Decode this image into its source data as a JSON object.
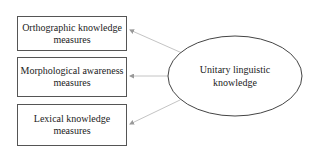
{
  "diagram": {
    "factor": {
      "line1": "Unitary linguistic",
      "line2": "knowledge"
    },
    "indicators": [
      {
        "line1": "Orthographic knowledge",
        "line2": "measures"
      },
      {
        "line1": "Morphological awareness",
        "line2": "measures"
      },
      {
        "line1": "Lexical knowledge",
        "line2": "measures"
      }
    ],
    "colors": {
      "box_border": "#555555",
      "ellipse_border": "#444444",
      "arrow": "#bbbbbb",
      "text": "#222222"
    }
  }
}
